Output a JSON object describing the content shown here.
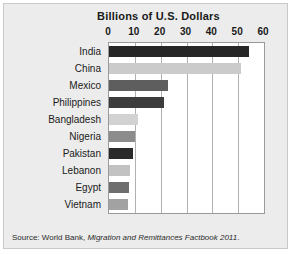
{
  "figure": {
    "background_color": "#ececec",
    "border_color": "#c9c9c9",
    "plot_background_color": "#ffffff",
    "gridline_color": "#b0b0b0"
  },
  "source_note": {
    "prefix": "Source: World Bank, ",
    "italic_part": "Migration and Remittances Factbook 2011",
    "suffix": "."
  },
  "chart_data": {
    "type": "bar",
    "orientation": "horizontal",
    "title": "Billions of U.S. Dollars",
    "xlabel": "",
    "ylabel": "",
    "xlim": [
      0,
      60
    ],
    "xticks": [
      0,
      10,
      20,
      30,
      40,
      50,
      60
    ],
    "xtick_labels": [
      "0",
      "10",
      "20",
      "30",
      "40",
      "50",
      "60"
    ],
    "grid": "vertical",
    "legend": "none",
    "categories": [
      "India",
      "China",
      "Mexico",
      "Philippines",
      "Bangladesh",
      "Nigeria",
      "Pakistan",
      "Lebanon",
      "Egypt",
      "Vietnam"
    ],
    "values": [
      54,
      51,
      23,
      21.3,
      11.1,
      10,
      9.4,
      8.2,
      7.7,
      7.2
    ],
    "bar_colors": [
      "#262626",
      "#cbcbcb",
      "#5e5e5e",
      "#3c3c3c",
      "#d2d2d2",
      "#8c8c8c",
      "#2a2a2a",
      "#c2c2c2",
      "#6e6e6e",
      "#a2a2a2"
    ]
  }
}
